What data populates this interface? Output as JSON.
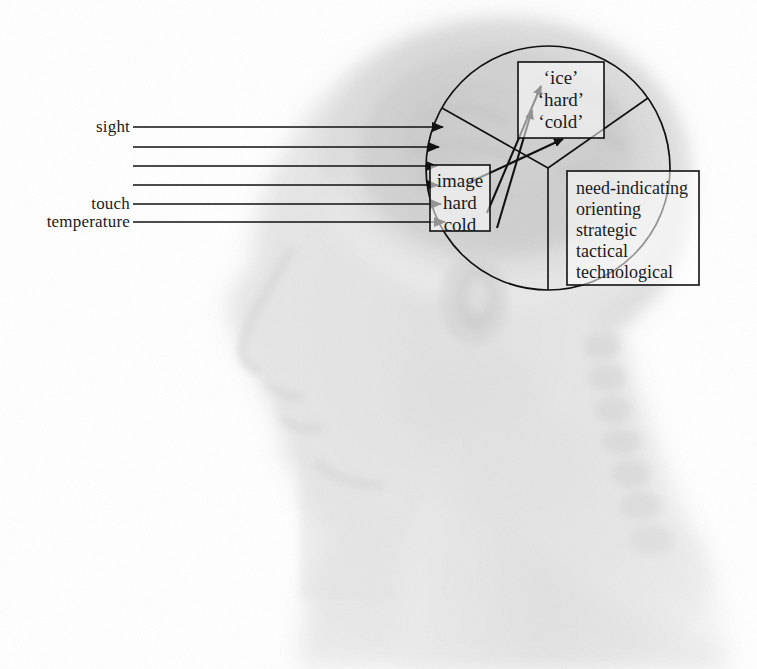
{
  "figure": {
    "background_color": "#ffffff",
    "line_color": "#1a1a1a",
    "head_image": {
      "description": "faint grayscale radiographic profile of a human head facing left",
      "tint": "#9a9a9a"
    }
  },
  "sensory_inputs": {
    "arrow_count": 6,
    "arrows": [
      {
        "index": 1,
        "label": "sight",
        "has_label": true,
        "y": 127
      },
      {
        "index": 2,
        "label": "",
        "has_label": false,
        "y": 147
      },
      {
        "index": 3,
        "label": "",
        "has_label": false,
        "y": 166
      },
      {
        "index": 4,
        "label": "",
        "has_label": false,
        "y": 185
      },
      {
        "index": 5,
        "label": "touch",
        "has_label": true,
        "y": 204
      },
      {
        "index": 6,
        "label": "temperature",
        "has_label": true,
        "y": 222
      }
    ],
    "labels": {
      "sight": "sight",
      "touch": "touch",
      "temperature": "temperature"
    }
  },
  "brain_circle": {
    "center_x": 548,
    "center_y": 168,
    "radius": 122,
    "sectors": [
      {
        "name": "sensory-image-sector",
        "start_deg": 180,
        "end_deg": 295
      },
      {
        "name": "percept-label-sector",
        "start_deg": 295,
        "end_deg": 35
      },
      {
        "name": "action-mode-sector",
        "start_deg": 35,
        "end_deg": 90
      }
    ]
  },
  "boxes": {
    "percept_labels": {
      "name": "percept-labels-box",
      "lines": [
        "‘ice’",
        "‘hard’",
        "‘cold’"
      ],
      "x": 518,
      "y": 62,
      "width": 86,
      "height": 76
    },
    "percept_qualities": {
      "name": "percept-qualities-box",
      "lines": [
        "image",
        "hard",
        "cold"
      ],
      "x": 430,
      "y": 165,
      "width": 60,
      "height": 66
    },
    "action_modes": {
      "name": "action-modes-box",
      "lines": [
        "need-indicating",
        "orienting",
        "strategic",
        "tactical",
        "technological"
      ],
      "x": 567,
      "y": 171,
      "width": 132,
      "height": 114
    }
  },
  "internal_arrows": [
    {
      "name": "arrow-image-to-ice",
      "x1": 487,
      "y1": 213,
      "x2": 541,
      "y2": 86
    },
    {
      "name": "arrow-hard-to-hard",
      "x1": 497,
      "y1": 228,
      "x2": 532,
      "y2": 110
    },
    {
      "name": "arrow-cold-to-cold",
      "x1": 468,
      "y1": 183,
      "x2": 563,
      "y2": 139
    }
  ]
}
